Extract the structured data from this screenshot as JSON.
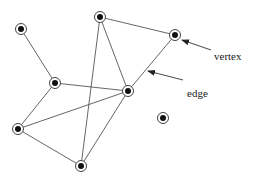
{
  "diagram": {
    "type": "graph",
    "labels": {
      "vertex": "vertex",
      "edge": "edge"
    },
    "vertices": [
      {
        "id": "A",
        "x": 21,
        "y": 29
      },
      {
        "id": "B",
        "x": 55,
        "y": 83
      },
      {
        "id": "C",
        "x": 100,
        "y": 17
      },
      {
        "id": "D",
        "x": 128,
        "y": 91
      },
      {
        "id": "E",
        "x": 175,
        "y": 35
      },
      {
        "id": "F",
        "x": 18,
        "y": 129
      },
      {
        "id": "G",
        "x": 81,
        "y": 166
      },
      {
        "id": "H",
        "x": 163,
        "y": 118
      }
    ],
    "edges": [
      [
        "A",
        "B"
      ],
      [
        "B",
        "D"
      ],
      [
        "B",
        "F"
      ],
      [
        "C",
        "E"
      ],
      [
        "C",
        "D"
      ],
      [
        "C",
        "G"
      ],
      [
        "E",
        "D"
      ],
      [
        "F",
        "D"
      ],
      [
        "F",
        "G"
      ],
      [
        "G",
        "D"
      ]
    ],
    "annotations": [
      {
        "label_key": "vertex",
        "text_x": 214,
        "text_y": 51,
        "arrow_from": [
          211,
          50
        ],
        "arrow_to": [
          182,
          40
        ]
      },
      {
        "label_key": "edge",
        "text_x": 187,
        "text_y": 88,
        "arrow_from": [
          183,
          80
        ],
        "arrow_to": [
          148,
          71
        ]
      }
    ],
    "colors": {
      "edge": "#555555",
      "vertex_fill": "#111111",
      "vertex_ring": "#444444",
      "background": "#ffffff"
    }
  }
}
